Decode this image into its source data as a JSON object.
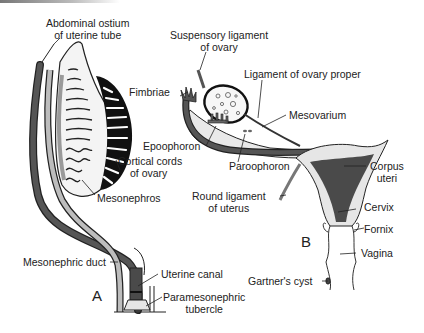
{
  "figure": {
    "panels": [
      {
        "letter": "A",
        "labels": {
          "abdominal_ostium_l1": "Abdominal ostium",
          "abdominal_ostium_l2": "of uterine tube",
          "cortical_cords_l1": "Cortical cords",
          "cortical_cords_l2": "of ovary",
          "mesonephros": "Mesonephros",
          "mesonephric_duct": "Mesonephric duct",
          "uterine_canal": "Uterine canal",
          "paramesonephric_l1": "Paramesonephric",
          "paramesonephric_l2": "tubercle"
        }
      },
      {
        "letter": "B",
        "labels": {
          "suspensory_l1": "Suspensory ligament",
          "suspensory_l2": "of ovary",
          "ligament_ovary_proper": "Ligament of ovary proper",
          "fimbriae": "Fimbriae",
          "mesovarium": "Mesovarium",
          "epoophoron": "Epoophoron",
          "paroophoron": "Paroophoron",
          "round_ligament_l1": "Round ligament",
          "round_ligament_l2": "of uterus",
          "corpus_l1": "Corpus",
          "corpus_l2": "uteri",
          "cervix": "Cervix",
          "fornix": "Fornix",
          "vagina": "Vagina",
          "gartners_cyst": "Gartner's cyst"
        }
      }
    ],
    "colors": {
      "dark_duct": "#4a4a4a",
      "light_duct": "#b8b8b8",
      "tissue": "#e6e6e6",
      "black": "#111111",
      "outline": "#222222"
    }
  }
}
